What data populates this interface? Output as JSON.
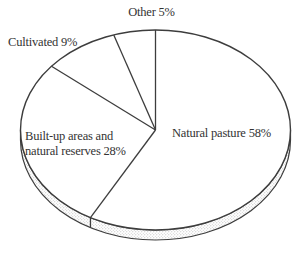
{
  "page": {
    "background": "#ffffff"
  },
  "chart_data": {
    "type": "pie",
    "title": "",
    "style": "3d-outline-monochrome",
    "start_angle_deg": 90,
    "direction": "clockwise",
    "slice_fill": "#ffffff",
    "stroke_color": "#3d3d3d",
    "rim_fill": "stipple-halftone",
    "legend": "none",
    "slices": [
      {
        "label": "Natural pasture",
        "value": 58,
        "display": "Natural pasture 58%",
        "label_position": "inside-right"
      },
      {
        "label": "Built-up areas and natural reserves",
        "value": 28,
        "display_lines": [
          "Built-up areas and",
          "natural reserves 28%"
        ],
        "label_position": "inside-left"
      },
      {
        "label": "Cultivated",
        "value": 9,
        "display": "Cultivated 9%",
        "label_position": "outside-upper-left"
      },
      {
        "label": "Other",
        "value": 5,
        "display": "Other 5%",
        "label_position": "outside-top"
      }
    ]
  }
}
